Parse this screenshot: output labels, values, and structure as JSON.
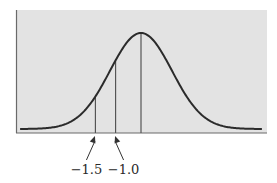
{
  "chart_data": {
    "type": "line",
    "title": "",
    "xlabel": "",
    "ylabel": "",
    "distribution": {
      "kind": "normal",
      "mean": 0,
      "sd": 1
    },
    "xlim": [
      -3.9,
      3.9
    ],
    "grid": false,
    "legend": "none",
    "reference_lines": [
      {
        "name": "z-minus-1-5",
        "label": "−1.5",
        "z": -1.5,
        "annotated": true
      },
      {
        "name": "z-minus-1-0",
        "label": "−1.0",
        "z": -1.0,
        "annotated": true
      },
      {
        "name": "mean",
        "label": "",
        "z": 0,
        "annotated": false
      }
    ]
  },
  "colors": {
    "plot_background": "#e3e3e3",
    "curve": "#2b2b2b",
    "lines": "#555555",
    "frame": "#6a6a6a"
  }
}
